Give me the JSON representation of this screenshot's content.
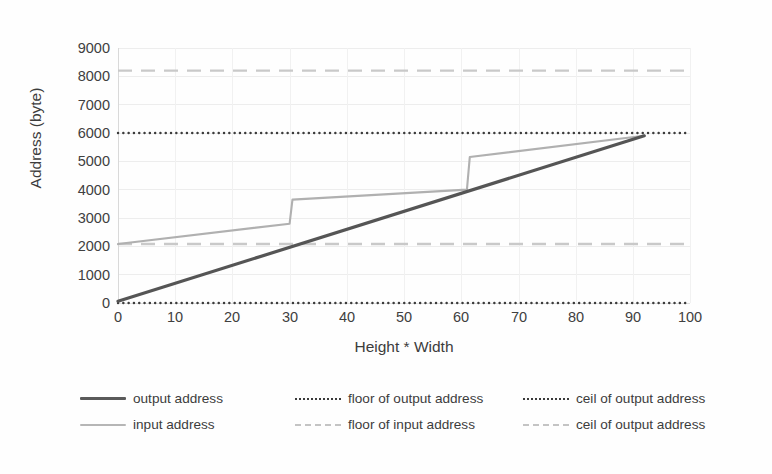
{
  "chart_data": {
    "type": "line",
    "title": "",
    "xlabel": "Height * Width",
    "ylabel": "Address (byte)",
    "xlim": [
      0,
      100
    ],
    "ylim": [
      0,
      9000
    ],
    "xticks": [
      "0",
      "10",
      "20",
      "30",
      "40",
      "50",
      "60",
      "70",
      "80",
      "90",
      "100"
    ],
    "yticks": [
      "0",
      "1000",
      "2000",
      "3000",
      "4000",
      "5000",
      "6000",
      "7000",
      "8000",
      "9000"
    ],
    "grid": true,
    "legend_position": "bottom",
    "series": [
      {
        "name": "output address",
        "style": "solid",
        "color": "#555555",
        "points": [
          [
            0,
            60
          ],
          [
            92,
            5900
          ]
        ]
      },
      {
        "name": "input address",
        "style": "solid",
        "color": "#b0b0b0",
        "points": [
          [
            0,
            2080
          ],
          [
            30,
            2800
          ],
          [
            30.5,
            3650
          ],
          [
            61,
            4000
          ],
          [
            61.5,
            5150
          ],
          [
            92,
            5900
          ]
        ]
      },
      {
        "name": "floor of output address",
        "style": "dotted",
        "color": "#3b3b3b",
        "points": [
          [
            0,
            0
          ],
          [
            100,
            0
          ]
        ]
      },
      {
        "name": "ceil of output address",
        "style": "dotted",
        "color": "#3b3b3b",
        "points": [
          [
            0,
            6000
          ],
          [
            100,
            6000
          ]
        ]
      },
      {
        "name": "floor of input address",
        "style": "dashed",
        "color": "#c9c9c9",
        "points": [
          [
            0,
            2080
          ],
          [
            100,
            2080
          ]
        ]
      },
      {
        "name": "ceil of output address",
        "style": "dashed",
        "color": "#c9c9c9",
        "points": [
          [
            0,
            8200
          ],
          [
            100,
            8200
          ]
        ]
      }
    ]
  },
  "axes": {
    "y_title": "Address (byte)",
    "x_title": "Height * Width",
    "y_ticks": [
      "9000",
      "8000",
      "7000",
      "6000",
      "5000",
      "4000",
      "3000",
      "2000",
      "1000",
      "0"
    ],
    "x_ticks": [
      "0",
      "10",
      "20",
      "30",
      "40",
      "50",
      "60",
      "70",
      "80",
      "90",
      "100"
    ]
  },
  "legend": {
    "entries": [
      {
        "label": "output address",
        "key": "solid-dark-line-icon"
      },
      {
        "label": "floor of output address",
        "key": "dotted-dark-line-icon"
      },
      {
        "label": "ceil of output address",
        "key": "dotted-dark-line-icon"
      },
      {
        "label": "input address",
        "key": "solid-light-line-icon"
      },
      {
        "label": "floor of input address",
        "key": "dashed-light-line-icon"
      },
      {
        "label": "ceil of output address",
        "key": "dashed-light-line-icon"
      }
    ]
  },
  "colors": {
    "output_address": "#555555",
    "input_address": "#b0b0b0",
    "floor_ceil_output": "#3b3b3b",
    "floor_ceil_input": "#c9c9c9",
    "grid": "#ededed",
    "text": "#3c3c3c",
    "background": "#ffffff"
  }
}
